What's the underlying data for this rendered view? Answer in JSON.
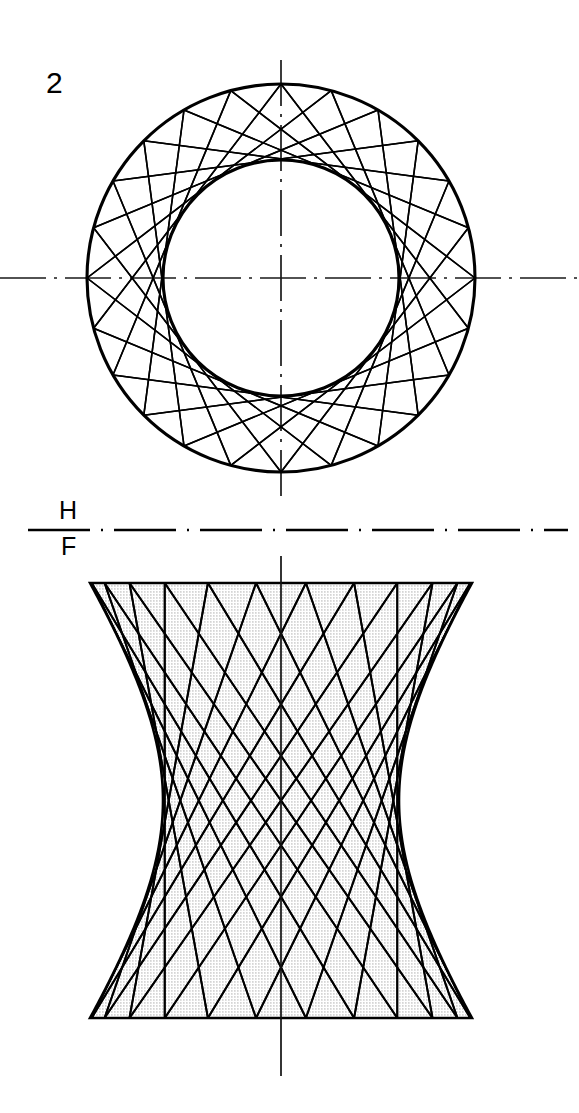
{
  "drawing": {
    "figure_number": "2",
    "title": "Hyperboloid of revolution generated by a skew line",
    "projection_labels": {
      "horizontal": "H",
      "frontal": "F"
    },
    "colors": {
      "line": "#000000",
      "surface_fill": "#efefef",
      "stipple_dot": "#8c8c8c",
      "background": "#ffffff",
      "center_line": "#1a1a1a"
    }
  },
  "top_view": {
    "name": "top-view",
    "center": {
      "x": 281,
      "y": 278
    },
    "outer_circle_radius": 194,
    "inner_circle_radius": 118,
    "divisions": 24,
    "chord_span_divisions": 7,
    "chord_sets": [
      "clockwise",
      "counterclockwise"
    ],
    "center_line_horizontal_y": 278,
    "center_line_vertical_x": 281,
    "center_line_horizontal_extent": [
      0,
      579
    ],
    "center_line_vertical_extent": [
      60,
      500
    ]
  },
  "reference_line": {
    "name": "hf-fold-line",
    "y": 530,
    "x_start": 28,
    "x_end": 568,
    "style": "long-dash chain line"
  },
  "front_view": {
    "name": "front-view",
    "top_y": 583,
    "bottom_y": 1018,
    "left_x": 88,
    "right_x": 470,
    "axis_x": 281,
    "half_width_top": 191,
    "half_width_throat": 118,
    "throat_y": 800,
    "generator_count": 24,
    "generator_sets": [
      "left-leaning",
      "right-leaning"
    ],
    "axis_extent": [
      556,
      1076
    ],
    "fill": "stippled"
  }
}
